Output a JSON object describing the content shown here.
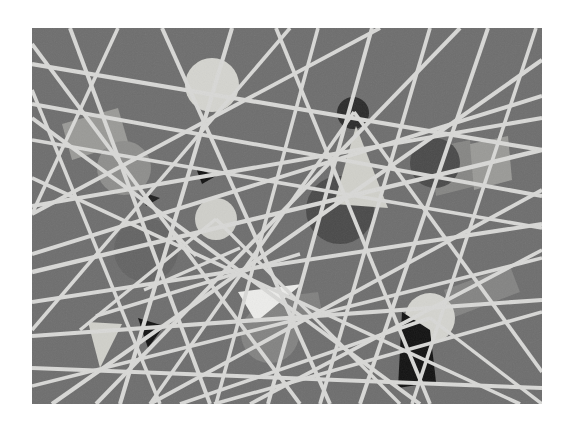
{
  "page": {
    "width": 574,
    "height": 432,
    "background": "#ffffff"
  },
  "canvas": {
    "x": 32,
    "y": 28,
    "width": 510,
    "height": 376,
    "background": "#6e6e6e",
    "texture": "grain"
  },
  "palette": {
    "background_gray": "#6e6e6e",
    "line_light": "#d8d8d6",
    "line_white": "#e8e8e6",
    "circle_pale": "#d4d4cf",
    "circle_light": "#cfcfca",
    "circle_mid": "#8e8e8c",
    "circle_gray": "#838382",
    "circle_dark": "#4a4a4a",
    "circle_darker": "#3e3e3e",
    "circle_near_black": "#2b2b2b",
    "circle_subtle_dark": "#646464",
    "shape_black": "#121212",
    "shape_pale": "#d0d0ca",
    "shape_white": "#ececea",
    "shape_light_band": "#9a9a97"
  },
  "chart_data": {
    "type": "scatter",
    "xlabel": "",
    "ylabel": "",
    "xlim": [
      32,
      542
    ],
    "ylim": [
      28,
      404
    ],
    "grid": false,
    "legend": "none",
    "lines": [
      {
        "name": "line-1",
        "x1": 32,
        "y1": 64,
        "x2": 542,
        "y2": 150,
        "width": 4.2,
        "color": "#d8d8d6"
      },
      {
        "name": "line-2",
        "x1": 32,
        "y1": 104,
        "x2": 542,
        "y2": 196,
        "width": 4.0,
        "color": "#d8d8d6"
      },
      {
        "name": "line-3",
        "x1": 32,
        "y1": 140,
        "x2": 542,
        "y2": 228,
        "width": 3.6,
        "color": "#d8d8d6"
      },
      {
        "name": "line-4",
        "x1": 32,
        "y1": 206,
        "x2": 542,
        "y2": 118,
        "width": 4.0,
        "color": "#d8d8d6"
      },
      {
        "name": "line-5",
        "x1": 32,
        "y1": 272,
        "x2": 542,
        "y2": 150,
        "width": 4.4,
        "color": "#d8d8d6"
      },
      {
        "name": "line-6",
        "x1": 32,
        "y1": 302,
        "x2": 542,
        "y2": 224,
        "width": 4.0,
        "color": "#d8d8d6"
      },
      {
        "name": "line-7",
        "x1": 32,
        "y1": 336,
        "x2": 542,
        "y2": 300,
        "width": 4.2,
        "color": "#d8d8d6"
      },
      {
        "name": "line-8",
        "x1": 32,
        "y1": 368,
        "x2": 542,
        "y2": 388,
        "width": 4.0,
        "color": "#d8d8d6"
      },
      {
        "name": "line-9",
        "x1": 32,
        "y1": 386,
        "x2": 542,
        "y2": 258,
        "width": 3.6,
        "color": "#d8d8d6"
      },
      {
        "name": "line-10",
        "x1": 70,
        "y1": 28,
        "x2": 210,
        "y2": 404,
        "width": 4.0,
        "color": "#d8d8d6"
      },
      {
        "name": "line-11",
        "x1": 118,
        "y1": 28,
        "x2": 32,
        "y2": 214,
        "width": 3.6,
        "color": "#d8d8d6"
      },
      {
        "name": "line-12",
        "x1": 162,
        "y1": 28,
        "x2": 330,
        "y2": 404,
        "width": 4.0,
        "color": "#d8d8d6"
      },
      {
        "name": "line-13",
        "x1": 232,
        "y1": 28,
        "x2": 120,
        "y2": 404,
        "width": 4.2,
        "color": "#d8d8d6"
      },
      {
        "name": "line-14",
        "x1": 276,
        "y1": 28,
        "x2": 430,
        "y2": 404,
        "width": 3.8,
        "color": "#d8d8d6"
      },
      {
        "name": "line-15",
        "x1": 318,
        "y1": 28,
        "x2": 216,
        "y2": 404,
        "width": 3.6,
        "color": "#d8d8d6"
      },
      {
        "name": "line-16",
        "x1": 372,
        "y1": 28,
        "x2": 268,
        "y2": 404,
        "width": 4.0,
        "color": "#d8d8d6"
      },
      {
        "name": "line-17",
        "x1": 430,
        "y1": 28,
        "x2": 320,
        "y2": 404,
        "width": 3.8,
        "color": "#d8d8d6"
      },
      {
        "name": "line-18",
        "x1": 488,
        "y1": 28,
        "x2": 360,
        "y2": 404,
        "width": 4.0,
        "color": "#d8d8d6"
      },
      {
        "name": "line-19",
        "x1": 536,
        "y1": 28,
        "x2": 412,
        "y2": 404,
        "width": 3.6,
        "color": "#d8d8d6"
      },
      {
        "name": "line-20",
        "x1": 32,
        "y1": 44,
        "x2": 300,
        "y2": 404,
        "width": 3.8,
        "color": "#d8d8d6"
      },
      {
        "name": "line-21",
        "x1": 32,
        "y1": 118,
        "x2": 420,
        "y2": 404,
        "width": 4.0,
        "color": "#d8d8d6"
      },
      {
        "name": "line-22",
        "x1": 32,
        "y1": 178,
        "x2": 520,
        "y2": 404,
        "width": 3.6,
        "color": "#d8d8d6"
      },
      {
        "name": "line-23",
        "x1": 32,
        "y1": 254,
        "x2": 542,
        "y2": 96,
        "width": 4.0,
        "color": "#d8d8d6"
      },
      {
        "name": "line-24",
        "x1": 52,
        "y1": 404,
        "x2": 542,
        "y2": 60,
        "width": 4.2,
        "color": "#d8d8d6"
      },
      {
        "name": "line-25",
        "x1": 150,
        "y1": 404,
        "x2": 542,
        "y2": 190,
        "width": 3.8,
        "color": "#d8d8d6"
      },
      {
        "name": "line-26",
        "x1": 250,
        "y1": 404,
        "x2": 542,
        "y2": 250,
        "width": 3.6,
        "color": "#d8d8d6"
      },
      {
        "name": "line-27",
        "x1": 32,
        "y1": 214,
        "x2": 380,
        "y2": 28,
        "width": 3.8,
        "color": "#d8d8d6"
      },
      {
        "name": "line-28",
        "x1": 32,
        "y1": 330,
        "x2": 290,
        "y2": 28,
        "width": 3.6,
        "color": "#d8d8d6"
      },
      {
        "name": "line-29",
        "x1": 96,
        "y1": 404,
        "x2": 460,
        "y2": 28,
        "width": 4.0,
        "color": "#d8d8d6"
      },
      {
        "name": "line-30",
        "x1": 214,
        "y1": 404,
        "x2": 542,
        "y2": 312,
        "width": 3.6,
        "color": "#d8d8d6"
      },
      {
        "name": "line-31",
        "x1": 354,
        "y1": 112,
        "x2": 542,
        "y2": 372,
        "width": 3.8,
        "color": "#d8d8d6"
      },
      {
        "name": "line-32",
        "x1": 354,
        "y1": 112,
        "x2": 150,
        "y2": 404,
        "width": 3.6,
        "color": "#d8d8d6"
      },
      {
        "name": "line-33",
        "x1": 216,
        "y1": 219,
        "x2": 80,
        "y2": 330,
        "width": 3.4,
        "color": "#d8d8d6"
      },
      {
        "name": "line-34",
        "x1": 216,
        "y1": 219,
        "x2": 400,
        "y2": 404,
        "width": 3.4,
        "color": "#d8d8d6"
      },
      {
        "name": "line-35",
        "x1": 430,
        "y1": 318,
        "x2": 180,
        "y2": 404,
        "width": 3.6,
        "color": "#d8d8d6"
      },
      {
        "name": "line-36",
        "x1": 430,
        "y1": 318,
        "x2": 542,
        "y2": 404,
        "width": 3.4,
        "color": "#d8d8d6"
      },
      {
        "name": "line-37",
        "x1": 32,
        "y1": 90,
        "x2": 160,
        "y2": 404,
        "width": 3.6,
        "color": "#d8d8d6"
      },
      {
        "name": "line-38",
        "x1": 96,
        "y1": 316,
        "x2": 300,
        "y2": 254,
        "width": 3.4,
        "color": "#d8d8d6"
      },
      {
        "name": "line-39",
        "x1": 144,
        "y1": 290,
        "x2": 240,
        "y2": 248,
        "width": 3.4,
        "color": "#d8d8d6"
      },
      {
        "name": "line-40",
        "x1": 172,
        "y1": 230,
        "x2": 196,
        "y2": 256,
        "width": 3.2,
        "color": "#d8d8d6"
      }
    ],
    "circles": [
      {
        "name": "circle-pale-top",
        "cx": 212,
        "cy": 85,
        "r": 27,
        "color": "#d4d4cf",
        "opacity": 1.0
      },
      {
        "name": "circle-mid-left",
        "cx": 124,
        "cy": 168,
        "r": 27,
        "color": "#8e8e8c",
        "opacity": 1.0
      },
      {
        "name": "circle-near-black",
        "cx": 353,
        "cy": 113,
        "r": 16,
        "color": "#2b2b2b",
        "opacity": 1.0
      },
      {
        "name": "circle-dark-right",
        "cx": 435,
        "cy": 163,
        "r": 25,
        "color": "#4a4a4a",
        "opacity": 1.0
      },
      {
        "name": "circle-dark-center",
        "cx": 340,
        "cy": 210,
        "r": 34,
        "color": "#4a4a4a",
        "opacity": 1.0
      },
      {
        "name": "circle-subtle-left",
        "cx": 146,
        "cy": 250,
        "r": 32,
        "color": "#646464",
        "opacity": 1.0
      },
      {
        "name": "circle-light-center",
        "cx": 216,
        "cy": 219,
        "r": 21,
        "color": "#cfcfca",
        "opacity": 1.0
      },
      {
        "name": "circle-gray-bottom",
        "cx": 270,
        "cy": 334,
        "r": 29,
        "color": "#838382",
        "opacity": 1.0
      },
      {
        "name": "circle-pale-right",
        "cx": 430,
        "cy": 318,
        "r": 25,
        "color": "#d4d4cf",
        "opacity": 1.0
      }
    ],
    "polygons": [
      {
        "name": "band-left-light",
        "points": "62,124 118,108 128,142 72,160",
        "color": "#9a9a97",
        "opacity": 1.0
      },
      {
        "name": "band-right-light",
        "points": "470,144 508,136 512,180 474,190",
        "color": "#9a9a97",
        "opacity": 1.0
      },
      {
        "name": "band-right-lower",
        "points": "430,148 470,140 476,186 436,196",
        "color": "#9a9a97",
        "opacity": 0.55
      },
      {
        "name": "triangle-pale-mid",
        "points": "356,126 334,204 388,208",
        "color": "#d0d0ca",
        "opacity": 1.0
      },
      {
        "name": "triangle-pale-low",
        "points": "88,322 122,324 100,368",
        "color": "#d0d0ca",
        "opacity": 1.0
      },
      {
        "name": "triangle-white-mid",
        "points": "238,292 302,284 256,322",
        "color": "#ececea",
        "opacity": 1.0
      },
      {
        "name": "triangle-black-sm",
        "points": "138,318 164,326 148,348",
        "color": "#121212",
        "opacity": 1.0
      },
      {
        "name": "triangle-black-tiny",
        "points": "196,168 216,176 202,184",
        "color": "#121212",
        "opacity": 1.0
      },
      {
        "name": "triangle-black-tiny2",
        "points": "142,192 160,198 146,206",
        "color": "#121212",
        "opacity": 0.85
      },
      {
        "name": "quad-black-right",
        "points": "402,312 430,330 436,382 398,388",
        "color": "#121212",
        "opacity": 1.0
      },
      {
        "name": "band-lower-right",
        "points": "444,290 510,266 520,292 452,318",
        "color": "#9a9a97",
        "opacity": 0.5
      },
      {
        "name": "band-mid-faint",
        "points": "256,300 318,292 322,312 260,322",
        "color": "#9a9a97",
        "opacity": 0.45
      }
    ]
  }
}
